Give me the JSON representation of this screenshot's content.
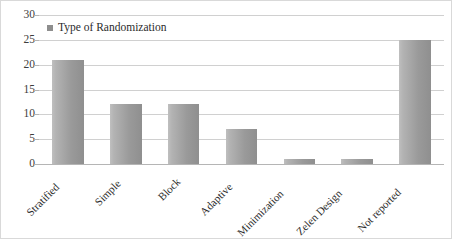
{
  "chart_data": {
    "type": "bar",
    "title": "",
    "subtitle": "",
    "xlabel": "",
    "ylabel": "",
    "categories": [
      "Stratified",
      "Simple",
      "Block",
      "Adaptive",
      "Minimization",
      "Zelen Design",
      "Not reported"
    ],
    "values": [
      21,
      12,
      12,
      7,
      1,
      1,
      25
    ],
    "series": [
      {
        "name": "Type of Randomization",
        "values": [
          21,
          12,
          12,
          7,
          1,
          1,
          25
        ]
      }
    ],
    "ylim": [
      0,
      30
    ],
    "ytick_labels": [
      "0",
      "5",
      "10",
      "15",
      "20",
      "25",
      "30"
    ],
    "ytick_values": [
      0,
      5,
      10,
      15,
      20,
      25,
      30
    ],
    "grid": true,
    "legend": {
      "position": "top-left-inside",
      "entries": [
        {
          "label": "Type of Randomization",
          "marker": "square",
          "color": "#8e8e8e"
        }
      ]
    },
    "annotations": [],
    "colors": {
      "bar_light": "#bfbfbf",
      "bar_dark": "#8f8f8f",
      "gridline": "#d0d0d0",
      "axis": "#b5b5b5",
      "text": "#2b2b2b",
      "border": "#d9d9d9",
      "background": "#ffffff"
    },
    "xlabel_rotation_deg": -45
  }
}
